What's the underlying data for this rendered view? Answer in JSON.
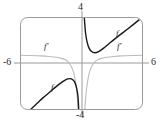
{
  "figure": {
    "kind": "cartesian-graph",
    "background_color": "#ffffff",
    "frame_color": "#8a8a8a",
    "axis_color": "#8a8a8a",
    "function_color": "#1a1a1a",
    "derivative_color": "#b0b0b0"
  },
  "axis_labels": {
    "y_max": "4",
    "y_min": "-4",
    "x_min": "-6",
    "x_max": "6"
  },
  "curve_labels": {
    "f_upper": "f",
    "f_lower": "f",
    "fprime_left": "f'",
    "fprime_right": "f'"
  },
  "chart_data": {
    "type": "line",
    "title": "",
    "xlabel": "",
    "ylabel": "",
    "xlim": [
      -6,
      6
    ],
    "ylim": [
      -4,
      4
    ],
    "grid": false,
    "legend": "inline-curve-labels",
    "tick_labels": {
      "x": [
        "-6",
        "6"
      ],
      "y": [
        "-4",
        "4"
      ]
    },
    "asymptote": {
      "type": "vertical",
      "x": 0
    },
    "series": [
      {
        "name": "f",
        "label": "f",
        "color": "#1a1a1a",
        "width": 1.4,
        "branches": [
          {
            "name": "f-upper-right",
            "description": "Descends from top of window just right of the y-axis, reaches a local minimum near x = 1.3, then rises to the top-right corner.",
            "points": [
              [
                0.28,
                4.0
              ],
              [
                0.4,
                2.7
              ],
              [
                0.55,
                1.9
              ],
              [
                0.75,
                1.35
              ],
              [
                1.0,
                1.05
              ],
              [
                1.3,
                0.95
              ],
              [
                1.7,
                1.05
              ],
              [
                2.2,
                1.35
              ],
              [
                2.8,
                1.8
              ],
              [
                3.5,
                2.3
              ],
              [
                4.3,
                2.85
              ],
              [
                5.1,
                3.4
              ],
              [
                5.8,
                3.9
              ]
            ]
          },
          {
            "name": "f-lower-left",
            "description": "Rises from the bottom-left of the window, reaches a local maximum near x = -1.2, then falls steeply to the bottom of the window at the asymptote.",
            "points": [
              [
                -5.0,
                -4.0
              ],
              [
                -4.4,
                -3.5
              ],
              [
                -3.8,
                -3.0
              ],
              [
                -3.2,
                -2.55
              ],
              [
                -2.6,
                -2.1
              ],
              [
                -2.1,
                -1.75
              ],
              [
                -1.7,
                -1.5
              ],
              [
                -1.35,
                -1.35
              ],
              [
                -1.0,
                -1.35
              ],
              [
                -0.7,
                -1.6
              ],
              [
                -0.5,
                -2.1
              ],
              [
                -0.35,
                -2.9
              ],
              [
                -0.28,
                -4.0
              ]
            ]
          }
        ]
      },
      {
        "name": "f'",
        "label": "f'",
        "color": "#b0b0b0",
        "width": 1.1,
        "branches": [
          {
            "name": "fprime-left",
            "description": "Nearly horizontal near y = 0.7 at the far left, bending sharply downward to negative infinity at the vertical asymptote x = 0.",
            "points": [
              [
                -6.0,
                0.72
              ],
              [
                -5.0,
                0.7
              ],
              [
                -4.0,
                0.67
              ],
              [
                -3.2,
                0.62
              ],
              [
                -2.5,
                0.55
              ],
              [
                -2.0,
                0.45
              ],
              [
                -1.6,
                0.32
              ],
              [
                -1.3,
                0.12
              ],
              [
                -1.05,
                -0.2
              ],
              [
                -0.85,
                -0.6
              ],
              [
                -0.7,
                -1.1
              ],
              [
                -0.58,
                -1.7
              ],
              [
                -0.48,
                -2.4
              ],
              [
                -0.4,
                -3.2
              ],
              [
                -0.34,
                -4.0
              ]
            ]
          },
          {
            "name": "fprime-right",
            "description": "Rises steeply from negative infinity at the asymptote x = 0 and flattens toward y = 0.7 at the right edge of the window.",
            "points": [
              [
                0.34,
                -4.0
              ],
              [
                0.4,
                -3.2
              ],
              [
                0.48,
                -2.4
              ],
              [
                0.58,
                -1.7
              ],
              [
                0.7,
                -1.1
              ],
              [
                0.85,
                -0.6
              ],
              [
                1.05,
                -0.2
              ],
              [
                1.3,
                0.12
              ],
              [
                1.6,
                0.32
              ],
              [
                2.0,
                0.45
              ],
              [
                2.5,
                0.55
              ],
              [
                3.2,
                0.62
              ],
              [
                4.0,
                0.67
              ],
              [
                5.0,
                0.7
              ],
              [
                6.0,
                0.72
              ]
            ]
          }
        ]
      }
    ]
  }
}
